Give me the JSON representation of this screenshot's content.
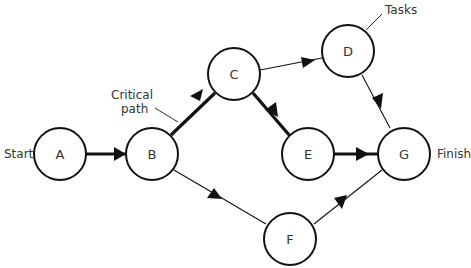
{
  "diagram": {
    "type": "network-diagram",
    "nodes": [
      {
        "id": "A",
        "label": "A"
      },
      {
        "id": "B",
        "label": "B"
      },
      {
        "id": "C",
        "label": "C"
      },
      {
        "id": "D",
        "label": "D"
      },
      {
        "id": "E",
        "label": "E"
      },
      {
        "id": "F",
        "label": "F"
      },
      {
        "id": "G",
        "label": "G"
      }
    ],
    "edges": [
      {
        "from": "A",
        "to": "B",
        "critical": true
      },
      {
        "from": "B",
        "to": "C",
        "critical": true
      },
      {
        "from": "C",
        "to": "E",
        "critical": true
      },
      {
        "from": "E",
        "to": "G",
        "critical": true
      },
      {
        "from": "C",
        "to": "D",
        "critical": false
      },
      {
        "from": "D",
        "to": "G",
        "critical": false
      },
      {
        "from": "B",
        "to": "F",
        "critical": false
      },
      {
        "from": "F",
        "to": "G",
        "critical": false
      }
    ],
    "labels": {
      "start": "Start",
      "finish": "Finish",
      "tasks": "Tasks",
      "critical_line1": "Critical",
      "critical_line2": "path"
    }
  }
}
